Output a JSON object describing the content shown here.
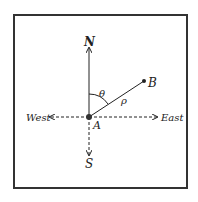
{
  "diagram": {
    "labels": {
      "north": "N",
      "south": "S",
      "east": "East",
      "west": "West",
      "origin": "A",
      "point": "B",
      "angle": "θ",
      "distance": "ρ"
    },
    "colors": {
      "line": "#222222",
      "frame": "#333333"
    }
  }
}
